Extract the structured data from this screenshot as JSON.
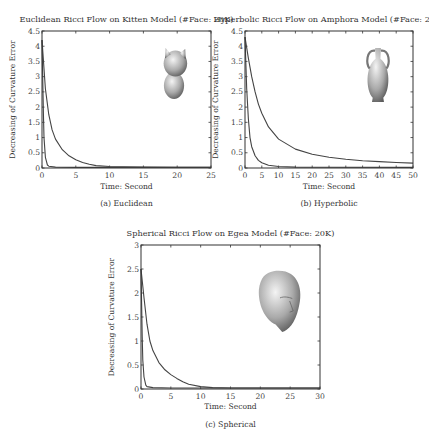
{
  "chart_data": [
    {
      "id": "a",
      "type": "line",
      "title": "Euclidean Ricci Flow on Kitten Model (#Face: 20K)",
      "caption": "(a) Euclidean",
      "xlabel": "Time: Second",
      "ylabel": "Decreasing of Curvature Error",
      "xlim": [
        0,
        25
      ],
      "ylim": [
        0,
        4.5
      ],
      "xticks": [
        0,
        5,
        10,
        15,
        20,
        25
      ],
      "yticks": [
        0,
        0.5,
        1,
        1.5,
        2,
        2.5,
        3,
        3.5,
        4,
        4.5
      ],
      "grid": false,
      "inset_image": "kitten-model",
      "series": [
        {
          "name": "slow",
          "x": [
            0,
            0.5,
            1,
            1.5,
            2,
            3,
            4,
            5,
            6,
            7,
            8,
            10,
            12,
            15,
            20,
            25
          ],
          "values": [
            4.2,
            2.6,
            1.75,
            1.25,
            0.95,
            0.6,
            0.4,
            0.27,
            0.18,
            0.12,
            0.08,
            0.05,
            0.04,
            0.03,
            0.02,
            0.02
          ]
        },
        {
          "name": "fast",
          "x": [
            0,
            0.1,
            0.2,
            0.3,
            0.5,
            0.8,
            1,
            2,
            5,
            25
          ],
          "values": [
            4.2,
            3.0,
            1.8,
            1.0,
            0.35,
            0.1,
            0.06,
            0.03,
            0.02,
            0.02
          ]
        }
      ]
    },
    {
      "id": "b",
      "type": "line",
      "title": "Hyperbolic Ricci Flow on Amphora Model (#Face: 20K)",
      "caption": "(b) Hyperbolic",
      "xlabel": "Time: Second",
      "ylabel": "Decreasing of Curvature Error",
      "xlim": [
        0,
        50
      ],
      "ylim": [
        0,
        4.5
      ],
      "xticks": [
        0,
        5,
        10,
        15,
        20,
        25,
        30,
        35,
        40,
        45,
        50
      ],
      "yticks": [
        0,
        0.5,
        1,
        1.5,
        2,
        2.5,
        3,
        3.5,
        4,
        4.5
      ],
      "grid": false,
      "inset_image": "amphora-model",
      "series": [
        {
          "name": "slow",
          "x": [
            0,
            1,
            2,
            3,
            4,
            5,
            7,
            10,
            15,
            20,
            25,
            30,
            35,
            40,
            45,
            50
          ],
          "values": [
            4.3,
            3.6,
            3.0,
            2.5,
            2.1,
            1.8,
            1.35,
            0.95,
            0.62,
            0.45,
            0.35,
            0.29,
            0.24,
            0.21,
            0.18,
            0.16
          ]
        },
        {
          "name": "fast",
          "x": [
            0,
            0.5,
            1,
            1.5,
            2,
            3,
            4,
            5,
            7,
            10,
            15,
            50
          ],
          "values": [
            4.3,
            2.6,
            1.6,
            1.0,
            0.7,
            0.4,
            0.25,
            0.17,
            0.09,
            0.05,
            0.03,
            0.02
          ]
        }
      ]
    },
    {
      "id": "c",
      "type": "line",
      "title": "Spherical Ricci Flow on Egea Model (#Face: 20K)",
      "caption": "(c) Spherical",
      "xlabel": "Time: Second",
      "ylabel": "Decreasing of Curvature Error",
      "xlim": [
        0,
        30
      ],
      "ylim": [
        0,
        3
      ],
      "xticks": [
        0,
        5,
        10,
        15,
        20,
        25,
        30
      ],
      "yticks": [
        0,
        0.5,
        1,
        1.5,
        2,
        2.5,
        3
      ],
      "grid": false,
      "inset_image": "egea-head-model",
      "series": [
        {
          "name": "slow",
          "x": [
            0,
            0.5,
            1,
            1.5,
            2,
            3,
            4,
            5,
            6,
            7,
            8,
            10,
            12,
            15,
            20,
            30
          ],
          "values": [
            2.5,
            1.9,
            1.35,
            1.0,
            0.8,
            0.55,
            0.4,
            0.3,
            0.22,
            0.15,
            0.1,
            0.05,
            0.03,
            0.02,
            0.02,
            0.02
          ]
        },
        {
          "name": "fast",
          "x": [
            0,
            0.1,
            0.2,
            0.3,
            0.5,
            0.8,
            1,
            2,
            5,
            30
          ],
          "values": [
            2.5,
            1.8,
            1.1,
            0.6,
            0.25,
            0.08,
            0.05,
            0.03,
            0.02,
            0.02
          ]
        }
      ]
    }
  ]
}
